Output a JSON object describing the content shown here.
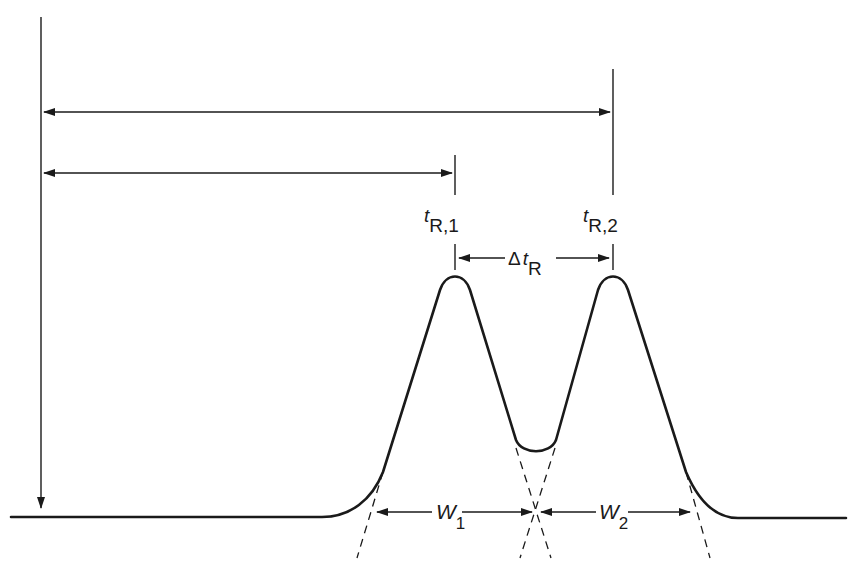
{
  "figure": {
    "type": "chromatogram-resolution-diagram",
    "colors": {
      "ink": "#1a1a1a",
      "background": "#ffffff"
    }
  },
  "labels": {
    "tR1": {
      "main": "t",
      "sub": "R,1"
    },
    "tR2": {
      "main": "t",
      "sub": "R,2"
    },
    "delta_tR": {
      "prefix": "Δ",
      "main": "t",
      "sub": "R"
    },
    "W1": {
      "main": "W",
      "sub": "1"
    },
    "W2": {
      "main": "W",
      "sub": "2"
    }
  },
  "geometry": {
    "injection_x": 41,
    "baseline_y": 517,
    "peak1_x": 455,
    "peak2_x": 613,
    "peak_apex_y": 276,
    "valley_y": 453,
    "width_arrow_y": 512,
    "tR2_arrow_y": 112,
    "tR1_arrow_y": 173
  }
}
